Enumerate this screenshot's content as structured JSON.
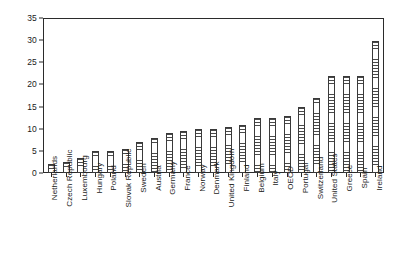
{
  "chart_data": {
    "type": "bar",
    "title": "",
    "subtitle": "",
    "xlabel": "",
    "ylabel": "",
    "ylim": [
      0,
      35
    ],
    "yticks": [
      0,
      5,
      10,
      15,
      20,
      25,
      30,
      35
    ],
    "grid": false,
    "legend": null,
    "categories": [
      "Netherlands",
      "Czech Republic",
      "Luxembourg",
      "Hungary",
      "Poland",
      "Slovak Republic",
      "Sweden",
      "Austria",
      "Germany",
      "France",
      "Norway",
      "Denmark",
      "United Kingdom",
      "Finland",
      "Belgium",
      "Italy",
      "OECD",
      "Portugal",
      "Switzerland",
      "United States",
      "Greece",
      "Spain",
      "Ireland"
    ],
    "values": [
      2,
      2.5,
      3.5,
      5,
      5,
      5.5,
      7,
      8,
      9,
      9.5,
      10,
      10,
      10.5,
      11,
      12.5,
      12.5,
      13,
      15,
      17,
      22,
      22,
      22,
      30
    ]
  },
  "style": {
    "bar_fill": "#ffffff",
    "bar_edge": "#3a3a3a",
    "axis_color": "#2b2b2b",
    "text_color": "#1a1a1a",
    "background": "#ffffff"
  }
}
